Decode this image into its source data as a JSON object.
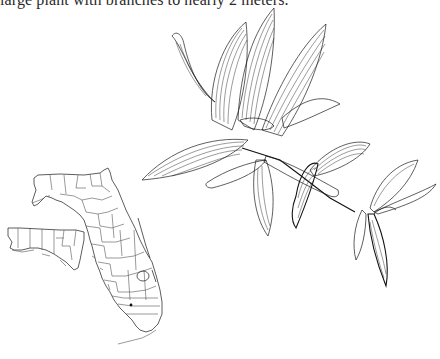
{
  "document": {
    "caption_text": "large plant with branches to nearly 2 meters."
  },
  "distribution_map": {
    "region": "Florida",
    "boundaries": "county lines",
    "inset": "panhandle shown offset to lower left",
    "occurrence_markers": [
      {
        "label": "occurrence-dot",
        "x": 131,
        "y": 305
      }
    ],
    "line_color": "#555555"
  },
  "illustration": {
    "subject": "botanical line drawing of flowering plant stem with leaves and flowers",
    "style": "pen-and-ink hatching",
    "ink_color": "#1a1a1a"
  }
}
